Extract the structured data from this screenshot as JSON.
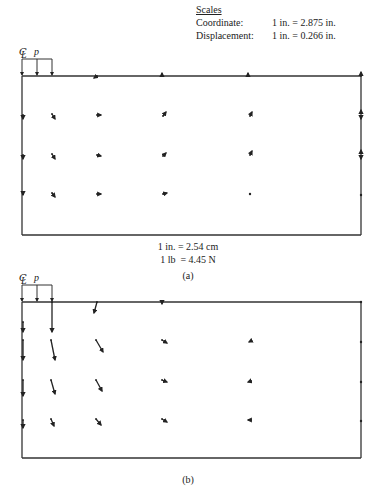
{
  "scales": {
    "title": "Scales",
    "coordinate_label": "Coordinate:",
    "coordinate_value": "1 in. = 2.875 in.",
    "displacement_label": "Displacement:",
    "displacement_value": "1 in. = 0.266 in."
  },
  "conversions": {
    "length": "1 in. = 2.54 cm",
    "force": "1 lb  = 4.45 N"
  },
  "panels": [
    {
      "caption": "(a)",
      "centerline_label": "CL",
      "load_label": "p",
      "box": {
        "x1": 22,
        "y1": 76,
        "x2": 361,
        "y2": 235
      },
      "vectors": [
        {
          "x": 97,
          "y": 76,
          "dx": -3,
          "dy": 2
        },
        {
          "x": 162,
          "y": 76,
          "dx": 0,
          "dy": -3
        },
        {
          "x": 248,
          "y": 76,
          "dx": 0,
          "dy": -3
        },
        {
          "x": 361,
          "y": 76,
          "dx": 0,
          "dy": -4
        },
        {
          "x": 23,
          "y": 115,
          "dx": 0,
          "dy": 4
        },
        {
          "x": 52,
          "y": 114,
          "dx": 3,
          "dy": 5
        },
        {
          "x": 97,
          "y": 115,
          "dx": 4,
          "dy": 0
        },
        {
          "x": 163,
          "y": 116,
          "dx": 3,
          "dy": -4
        },
        {
          "x": 250,
          "y": 116,
          "dx": 2,
          "dy": -4
        },
        {
          "x": 361,
          "y": 113,
          "dx": 0,
          "dy": -3
        },
        {
          "x": 361,
          "y": 117,
          "dx": 0,
          "dy": 2
        },
        {
          "x": 23,
          "y": 155,
          "dx": 0,
          "dy": 4
        },
        {
          "x": 52,
          "y": 154,
          "dx": 3,
          "dy": 5
        },
        {
          "x": 97,
          "y": 155,
          "dx": 4,
          "dy": 1
        },
        {
          "x": 163,
          "y": 156,
          "dx": 3,
          "dy": -3
        },
        {
          "x": 250,
          "y": 155,
          "dx": 2,
          "dy": -4
        },
        {
          "x": 361,
          "y": 153,
          "dx": 0,
          "dy": -3
        },
        {
          "x": 361,
          "y": 157,
          "dx": 0,
          "dy": 2
        },
        {
          "x": 23,
          "y": 194,
          "dx": 0,
          "dy": 1
        },
        {
          "x": 52,
          "y": 193,
          "dx": 3,
          "dy": 4
        },
        {
          "x": 97,
          "y": 194,
          "dx": 4,
          "dy": 0
        },
        {
          "x": 163,
          "y": 194,
          "dx": 4,
          "dy": -1
        },
        {
          "x": 250,
          "y": 194,
          "dx": 0,
          "dy": 0
        },
        {
          "x": 361,
          "y": 195,
          "dx": 0,
          "dy": 0
        }
      ]
    },
    {
      "caption": "(b)",
      "centerline_label": "CL",
      "load_label": "p",
      "box": {
        "x1": 22,
        "y1": 302,
        "x2": 361,
        "y2": 458
      },
      "vectors": [
        {
          "x": 97,
          "y": 302,
          "dx": -3,
          "dy": 11
        },
        {
          "x": 162,
          "y": 302,
          "dx": 0,
          "dy": 2
        },
        {
          "x": 361,
          "y": 302,
          "dx": 0,
          "dy": 0
        },
        {
          "x": 52,
          "y": 302,
          "dx": 0,
          "dy": 30
        },
        {
          "x": 23,
          "y": 322,
          "dx": 0,
          "dy": 10
        },
        {
          "x": 23,
          "y": 340,
          "dx": 0,
          "dy": 20
        },
        {
          "x": 51,
          "y": 340,
          "dx": 4,
          "dy": 20
        },
        {
          "x": 96,
          "y": 340,
          "dx": 7,
          "dy": 12
        },
        {
          "x": 162,
          "y": 340,
          "dx": 5,
          "dy": 3
        },
        {
          "x": 251,
          "y": 341,
          "dx": -2,
          "dy": 1
        },
        {
          "x": 361,
          "y": 342,
          "dx": 0,
          "dy": 0
        },
        {
          "x": 23,
          "y": 380,
          "dx": 0,
          "dy": 16
        },
        {
          "x": 51,
          "y": 380,
          "dx": 4,
          "dy": 14
        },
        {
          "x": 96,
          "y": 380,
          "dx": 6,
          "dy": 11
        },
        {
          "x": 162,
          "y": 380,
          "dx": 5,
          "dy": 2
        },
        {
          "x": 251,
          "y": 381,
          "dx": -3,
          "dy": 1
        },
        {
          "x": 361,
          "y": 382,
          "dx": 0,
          "dy": 0
        },
        {
          "x": 23,
          "y": 420,
          "dx": 0,
          "dy": 8
        },
        {
          "x": 51,
          "y": 419,
          "dx": 3,
          "dy": 7
        },
        {
          "x": 96,
          "y": 419,
          "dx": 5,
          "dy": 6
        },
        {
          "x": 162,
          "y": 419,
          "dx": 5,
          "dy": 3
        },
        {
          "x": 251,
          "y": 420,
          "dx": -3,
          "dy": 0
        },
        {
          "x": 361,
          "y": 421,
          "dx": 0,
          "dy": 0
        }
      ]
    }
  ]
}
